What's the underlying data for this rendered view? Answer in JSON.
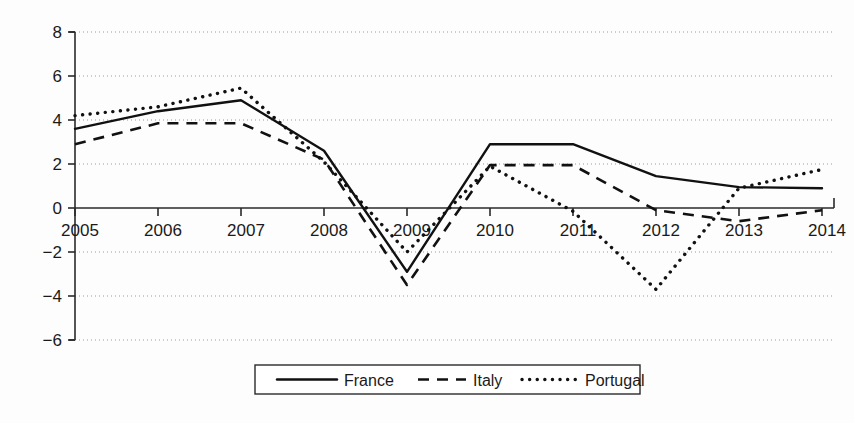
{
  "chart_data": {
    "type": "line",
    "title": "",
    "subtitle": "",
    "xlabel": "",
    "ylabel": "",
    "x": [
      2005,
      2006,
      2007,
      2008,
      2009,
      2010,
      2011,
      2012,
      2013,
      2014
    ],
    "categories": [
      "2005",
      "2006",
      "2007",
      "2008",
      "2009",
      "2010",
      "2011",
      "2012",
      "2013",
      "2014"
    ],
    "xtick_labels": [
      "2005",
      "2006",
      "2007",
      "2008",
      "2009",
      "2010",
      "2011",
      "2012",
      "2013",
      "2014"
    ],
    "ytick_labels": [
      "8",
      "6",
      "4",
      "2",
      "0",
      "-2",
      "-4",
      "-6"
    ],
    "ytick_values": [
      8,
      6,
      4,
      2,
      0,
      -2,
      -4,
      -6
    ],
    "ylim": [
      -6,
      8
    ],
    "xlim": [
      2005,
      2014
    ],
    "grid": true,
    "grid_axis": "y",
    "legend_position": "bottom-center",
    "zero_line": 0,
    "series": [
      {
        "name": "France",
        "style": "solid",
        "color": "#111111",
        "values": [
          3.6,
          4.4,
          4.9,
          2.6,
          -2.9,
          2.9,
          2.9,
          1.45,
          0.95,
          0.9
        ]
      },
      {
        "name": "Italy",
        "style": "dashed",
        "color": "#111111",
        "values": [
          2.9,
          3.85,
          3.85,
          2.2,
          -3.5,
          1.95,
          1.95,
          -0.1,
          -0.6,
          -0.1
        ]
      },
      {
        "name": "Portugal",
        "style": "dotted",
        "color": "#111111",
        "values": [
          4.2,
          4.6,
          5.45,
          2.1,
          -2.0,
          1.9,
          -0.15,
          -3.7,
          0.9,
          1.75
        ]
      }
    ]
  },
  "legend": {
    "items": [
      {
        "label": "France",
        "style": "solid"
      },
      {
        "label": "Italy",
        "style": "dashed"
      },
      {
        "label": "Portugal",
        "style": "dotted"
      }
    ]
  }
}
